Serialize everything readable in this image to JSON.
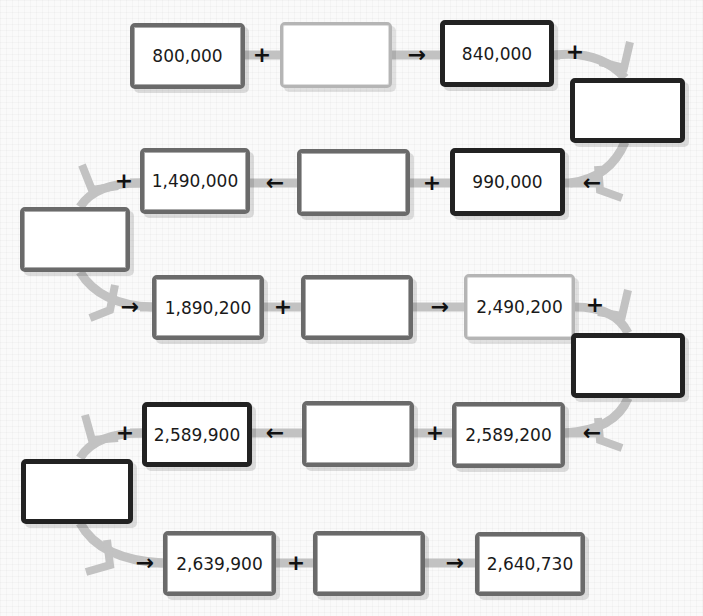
{
  "header": {
    "title": ""
  },
  "chain": [
    {
      "id": "r1c1",
      "value": "800,000"
    },
    {
      "id": "r1c2",
      "value": ""
    },
    {
      "id": "r1c3",
      "value": "840,000"
    },
    {
      "id": "right1",
      "value": ""
    },
    {
      "id": "r2c3",
      "value": "990,000"
    },
    {
      "id": "r2c2",
      "value": ""
    },
    {
      "id": "r2c1",
      "value": "1,490,000"
    },
    {
      "id": "left1",
      "value": ""
    },
    {
      "id": "r3c1",
      "value": "1,890,200"
    },
    {
      "id": "r3c2",
      "value": ""
    },
    {
      "id": "r3c3",
      "value": "2,490,200"
    },
    {
      "id": "right2",
      "value": ""
    },
    {
      "id": "r4c3",
      "value": "2,589,200"
    },
    {
      "id": "r4c2",
      "value": ""
    },
    {
      "id": "r4c1",
      "value": "2,589,900"
    },
    {
      "id": "left2",
      "value": ""
    },
    {
      "id": "r5c1",
      "value": "2,639,900"
    },
    {
      "id": "r5c2",
      "value": ""
    },
    {
      "id": "r5c3",
      "value": "2,640,730"
    }
  ],
  "symbols": {
    "plus": "+",
    "arrow_right": "→",
    "arrow_left": "←"
  },
  "colors": {
    "connector": "#bdbdbd",
    "dark_border": "#222222",
    "mid_border": "#6a6a6a",
    "light_border": "#b5b5b5"
  }
}
